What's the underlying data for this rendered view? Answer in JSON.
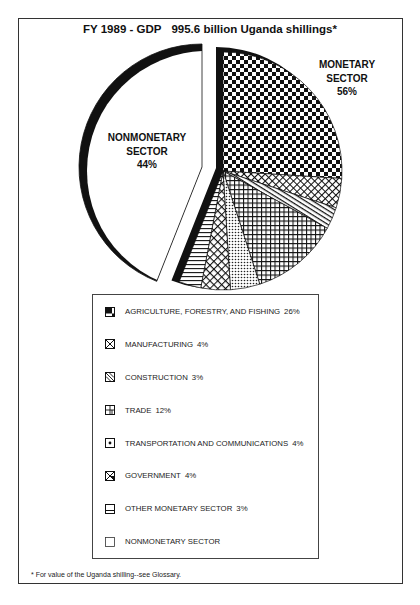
{
  "header": {
    "title_period": "FY 1989 - GDP",
    "title_total": "995.6 billion Uganda shillings*"
  },
  "labels": {
    "monetary": {
      "line1": "MONETARY",
      "line2": "SECTOR",
      "percent": "56%"
    },
    "nonmonetary": {
      "line1": "NONMONETARY",
      "line2": "SECTOR",
      "percent": "44%"
    }
  },
  "legend": {
    "items": [
      {
        "label": "AGRICULTURE, FORESTRY, AND FISHING",
        "value_text": "26%",
        "icon": "checker-pattern-icon"
      },
      {
        "label": "MANUFACTURING",
        "value_text": "4%",
        "icon": "crosshatch-pattern-icon"
      },
      {
        "label": "CONSTRUCTION",
        "value_text": "3%",
        "icon": "diagonal-stripes-icon"
      },
      {
        "label": "TRADE",
        "value_text": "12%",
        "icon": "grid-pattern-icon"
      },
      {
        "label": "TRANSPORTATION AND COMMUNICATIONS",
        "value_text": "4%",
        "icon": "dot-pattern-icon"
      },
      {
        "label": "GOVERNMENT",
        "value_text": "4%",
        "icon": "crosshatch-large-icon"
      },
      {
        "label": "OTHER MONETARY SECTOR",
        "value_text": "3%",
        "icon": "horizontal-stripes-icon"
      },
      {
        "label": "NONMONETARY SECTOR",
        "value_text": "",
        "icon": "blank-box-icon"
      }
    ]
  },
  "footnote": "* For value of the Uganda shilling--see Glossary.",
  "chart_data": {
    "type": "pie",
    "total": 995.6,
    "total_unit": "billion Uganda shillings",
    "groups": [
      {
        "name": "MONETARY SECTOR",
        "value": 56,
        "exploded": true
      },
      {
        "name": "NONMONETARY SECTOR",
        "value": 44,
        "exploded": true
      }
    ],
    "slices": [
      {
        "label": "AGRICULTURE, FORESTRY, AND FISHING",
        "value": 26,
        "group": "MONETARY SECTOR",
        "pattern": "checker"
      },
      {
        "label": "MANUFACTURING",
        "value": 4,
        "group": "MONETARY SECTOR",
        "pattern": "crosshatch"
      },
      {
        "label": "CONSTRUCTION",
        "value": 3,
        "group": "MONETARY SECTOR",
        "pattern": "diagonal"
      },
      {
        "label": "TRADE",
        "value": 12,
        "group": "MONETARY SECTOR",
        "pattern": "grid"
      },
      {
        "label": "TRANSPORTATION AND COMMUNICATIONS",
        "value": 4,
        "group": "MONETARY SECTOR",
        "pattern": "dots"
      },
      {
        "label": "GOVERNMENT",
        "value": 4,
        "group": "MONETARY SECTOR",
        "pattern": "crosshatch-lg"
      },
      {
        "label": "OTHER MONETARY SECTOR",
        "value": 3,
        "group": "MONETARY SECTOR",
        "pattern": "hlines"
      },
      {
        "label": "NONMONETARY SECTOR",
        "value": 44,
        "group": "NONMONETARY SECTOR",
        "pattern": "blank"
      }
    ],
    "units": "percent of GDP",
    "legend_position": "below",
    "footnote": "* For value of the Uganda shilling--see Glossary."
  }
}
